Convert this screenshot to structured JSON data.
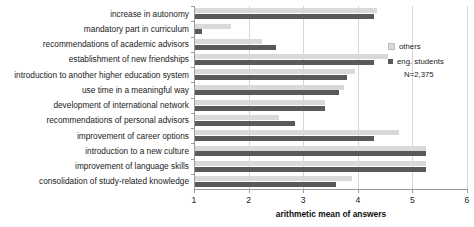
{
  "chart_data": {
    "type": "bar",
    "orientation": "horizontal",
    "title": "",
    "xlabel": "arithmetic mean of answers",
    "ylabel": "",
    "xlim": [
      1,
      6
    ],
    "xticks": [
      1,
      2,
      3,
      4,
      5,
      6
    ],
    "grid": true,
    "legend_position": "right",
    "annotation": "N=2,375",
    "categories": [
      "increase in autonomy",
      "mandatory part in curriculum",
      "recommendations of academic advisors",
      "establishment of new friendships",
      "introduction to another higher education system",
      "use time in a meaningful way",
      "development of international network",
      "recommendations of personal advisors",
      "improvement of career options",
      "introduction to a new culture",
      "improvement of language skills",
      "consolidation of study-related knowledge"
    ],
    "series": [
      {
        "name": "others",
        "color": "#d9d9d9",
        "values": [
          4.35,
          1.68,
          2.25,
          4.55,
          3.95,
          3.75,
          3.4,
          2.55,
          4.75,
          5.25,
          5.25,
          3.9
        ]
      },
      {
        "name": "eng. students",
        "color": "#595959",
        "values": [
          4.3,
          1.15,
          2.5,
          4.3,
          3.8,
          3.65,
          3.4,
          2.85,
          4.3,
          5.25,
          5.25,
          3.6
        ]
      }
    ]
  },
  "legend": {
    "items": [
      {
        "label": "others"
      },
      {
        "label": "eng. students"
      }
    ],
    "note": "N=2,375"
  },
  "axis": {
    "x_title": "arithmetic mean of answers"
  }
}
